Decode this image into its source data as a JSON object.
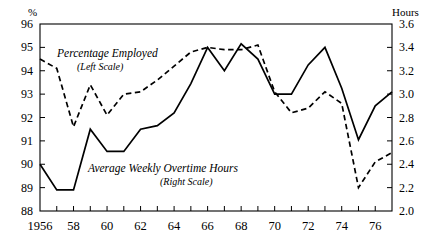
{
  "chart_data": {
    "type": "line",
    "title": "",
    "xlabel": "",
    "grid": false,
    "legend_position": "inline-annotations",
    "x": [
      1956,
      1957,
      1958,
      1959,
      1960,
      1961,
      1962,
      1963,
      1964,
      1965,
      1966,
      1967,
      1968,
      1969,
      1970,
      1971,
      1972,
      1973,
      1974,
      1975,
      1976,
      1977
    ],
    "x_tick_labels": [
      "1956",
      "",
      "58",
      "",
      "60",
      "",
      "62",
      "",
      "64",
      "",
      "66",
      "",
      "68",
      "",
      "70",
      "",
      "72",
      "",
      "74",
      "",
      "76",
      ""
    ],
    "x_major_labels": [
      "1956",
      "58",
      "60",
      "62",
      "64",
      "66",
      "68",
      "70",
      "72",
      "74",
      "76"
    ],
    "xlim": [
      1956,
      1977
    ],
    "left_axis": {
      "unit_label": "%",
      "ylim": [
        88,
        96
      ],
      "ticks": [
        88,
        89,
        90,
        91,
        92,
        93,
        94,
        95,
        96
      ],
      "tick_labels": [
        "88",
        "89",
        "90",
        "91",
        "92",
        "93",
        "94",
        "95",
        "96"
      ]
    },
    "right_axis": {
      "unit_label": "Hours",
      "ylim": [
        2.0,
        3.6
      ],
      "ticks": [
        2.0,
        2.2,
        2.4,
        2.6,
        2.8,
        3.0,
        3.2,
        3.4,
        3.6
      ],
      "tick_labels": [
        "2.0",
        "2.2",
        "2.4",
        "2.6",
        "2.8",
        "3.0",
        "3.2",
        "3.4",
        "3.6"
      ]
    },
    "series": [
      {
        "name": "Percentage Employed",
        "scale": "left",
        "style": "dashed",
        "color": "#000000",
        "annotation_line1": "Percentage Employed",
        "annotation_line2": "(Left Scale)",
        "values": [
          94.5,
          94.1,
          91.6,
          93.4,
          92.1,
          93.0,
          93.1,
          93.6,
          94.2,
          94.8,
          95.0,
          94.9,
          94.9,
          95.1,
          93.1,
          92.2,
          92.4,
          93.1,
          92.6,
          89.0,
          90.1,
          90.5
        ]
      },
      {
        "name": "Average Weekly Overtime Hours",
        "scale": "right",
        "style": "solid",
        "color": "#000000",
        "annotation_line1": "Average Weekly Overtime Hours",
        "annotation_line2": "(Right Scale)",
        "values": [
          2.4,
          2.18,
          2.18,
          2.7,
          2.51,
          2.51,
          2.7,
          2.73,
          2.84,
          3.09,
          3.4,
          3.2,
          3.43,
          3.3,
          3.0,
          3.0,
          3.25,
          3.4,
          3.05,
          2.61,
          2.9,
          3.02
        ]
      }
    ]
  }
}
